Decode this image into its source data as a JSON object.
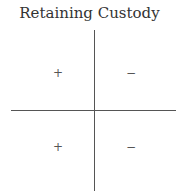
{
  "title": "Retaining Custody",
  "quadrants": {
    "top_left": "+",
    "top_right": "−",
    "bottom_left": "+",
    "bottom_right": "−"
  }
}
